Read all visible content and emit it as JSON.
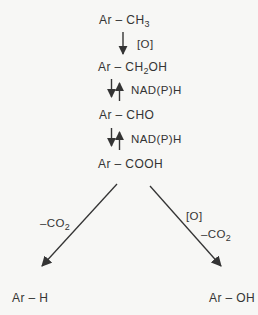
{
  "colors": {
    "bg": "#f7f7f5",
    "ink": "#343434"
  },
  "scheme": {
    "compounds": {
      "ch3": {
        "pre": "Ar – CH",
        "sub": "3",
        "post": ""
      },
      "ch2oh": {
        "pre": "Ar – CH",
        "sub": "2",
        "post": "OH"
      },
      "cho": {
        "pre": "Ar – CHO",
        "sub": "",
        "post": ""
      },
      "cooh": {
        "pre": "Ar – COOH",
        "sub": "",
        "post": ""
      },
      "ar_h": {
        "pre": "Ar – H",
        "sub": "",
        "post": ""
      },
      "ar_oh": {
        "pre": "Ar – OH",
        "sub": "",
        "post": ""
      }
    },
    "reagents": {
      "oxidation_top": "[O]",
      "nadph_1": "NAD(P)H",
      "nadph_2": "NAD(P)H",
      "left_co2": {
        "pre": "–CO",
        "sub": "2",
        "post": ""
      },
      "right_o": "[O]",
      "right_co2": {
        "pre": "–CO",
        "sub": "2",
        "post": ""
      }
    }
  }
}
